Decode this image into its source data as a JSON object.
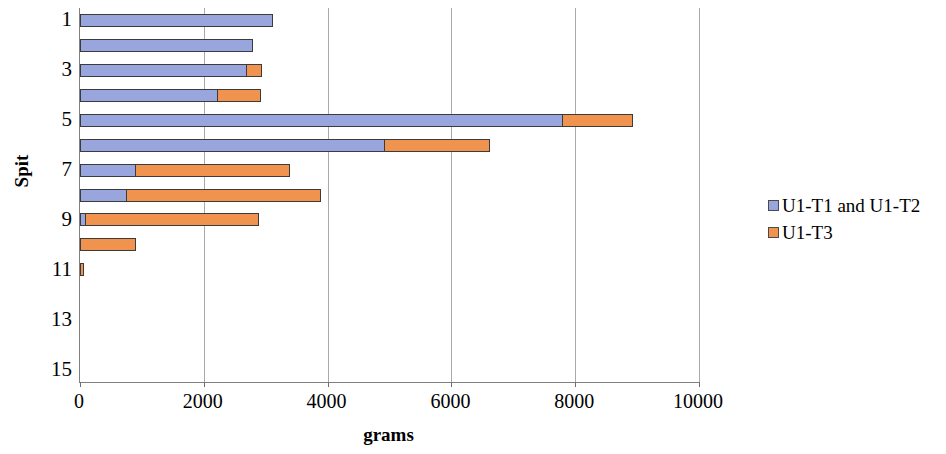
{
  "chart_data": {
    "type": "bar",
    "orientation": "horizontal",
    "stacked": true,
    "title": "",
    "xlabel": "grams",
    "ylabel": "Spit",
    "xlim": [
      0,
      10000
    ],
    "xticks": [
      "0",
      "2000",
      "4000",
      "6000",
      "8000",
      "10000"
    ],
    "xtick_values": [
      0,
      2000,
      4000,
      6000,
      8000,
      10000
    ],
    "yticks": [
      "1",
      "3",
      "5",
      "7",
      "9",
      "11",
      "13",
      "15"
    ],
    "ytick_values": [
      1,
      3,
      5,
      7,
      9,
      11,
      13,
      15
    ],
    "categories": [
      1,
      2,
      3,
      4,
      5,
      6,
      7,
      8,
      9,
      10,
      11,
      12,
      13,
      14,
      15
    ],
    "grid": true,
    "grid_axis": "x",
    "legend_position": "right",
    "series": [
      {
        "name": "U1-T1 and U1-T2",
        "color": "#99a5dd",
        "values": [
          3120,
          2800,
          2690,
          2230,
          7800,
          4930,
          900,
          760,
          100,
          0,
          0,
          0,
          0,
          0,
          0
        ]
      },
      {
        "name": "U1-T3",
        "color": "#f0934e",
        "values": [
          0,
          0,
          270,
          710,
          1150,
          1710,
          2510,
          3150,
          2810,
          900,
          60,
          0,
          0,
          0,
          0
        ]
      }
    ]
  },
  "axes": {
    "y_title": "Spit",
    "x_title": "grams"
  },
  "legend": {
    "items": [
      {
        "label": "U1-T1 and U1-T2",
        "color": "#99a5dd"
      },
      {
        "label": "U1-T3",
        "color": "#f0934e"
      }
    ]
  }
}
